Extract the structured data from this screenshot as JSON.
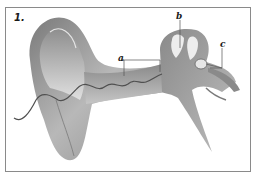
{
  "figure": {
    "number": "1.",
    "labels": [
      {
        "id": "a",
        "text": "a"
      },
      {
        "id": "b",
        "text": "b"
      },
      {
        "id": "c",
        "text": "c"
      }
    ]
  },
  "colors": {
    "frame_border": "#8a8a8a",
    "tissue_dark": "#6e6e6e",
    "tissue_mid": "#9c9c9c",
    "tissue_light": "#d4d4d4",
    "nerve_line": "#4a4a4a",
    "leader_line": "#555555"
  }
}
